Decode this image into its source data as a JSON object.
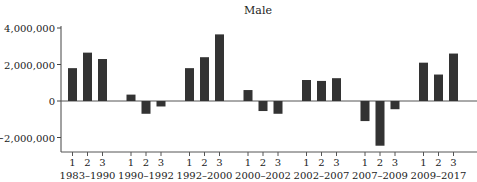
{
  "chart_data": {
    "type": "bar",
    "title": "Male",
    "xlabel": "",
    "ylabel": "",
    "ylim": [
      -2800000,
      4000000
    ],
    "yticks": [
      4000000,
      2000000,
      0,
      -2000000
    ],
    "ytick_labels": [
      "4,000,000",
      "2,000,000",
      "0",
      "−2,000,000"
    ],
    "grid": false,
    "legend": null,
    "groups": [
      {
        "label": "1983–1990",
        "sublabels": [
          "1",
          "2",
          "3"
        ],
        "values": [
          1800000,
          2650000,
          2300000
        ]
      },
      {
        "label": "1990–1992",
        "sublabels": [
          "1",
          "2",
          "3"
        ],
        "values": [
          350000,
          -700000,
          -300000
        ]
      },
      {
        "label": "1992–2000",
        "sublabels": [
          "1",
          "2",
          "3"
        ],
        "values": [
          1800000,
          2400000,
          3650000
        ]
      },
      {
        "label": "2000–2002",
        "sublabels": [
          "1",
          "2",
          "3"
        ],
        "values": [
          600000,
          -550000,
          -700000
        ]
      },
      {
        "label": "2002–2007",
        "sublabels": [
          "1",
          "2",
          "3"
        ],
        "values": [
          1150000,
          1100000,
          1250000
        ]
      },
      {
        "label": "2007–2009",
        "sublabels": [
          "1",
          "2",
          "3"
        ],
        "values": [
          -1100000,
          -2450000,
          -450000
        ]
      },
      {
        "label": "2009–2017",
        "sublabels": [
          "1",
          "2",
          "3"
        ],
        "values": [
          2100000,
          1450000,
          2600000
        ]
      }
    ],
    "bar_color": "#333333"
  }
}
